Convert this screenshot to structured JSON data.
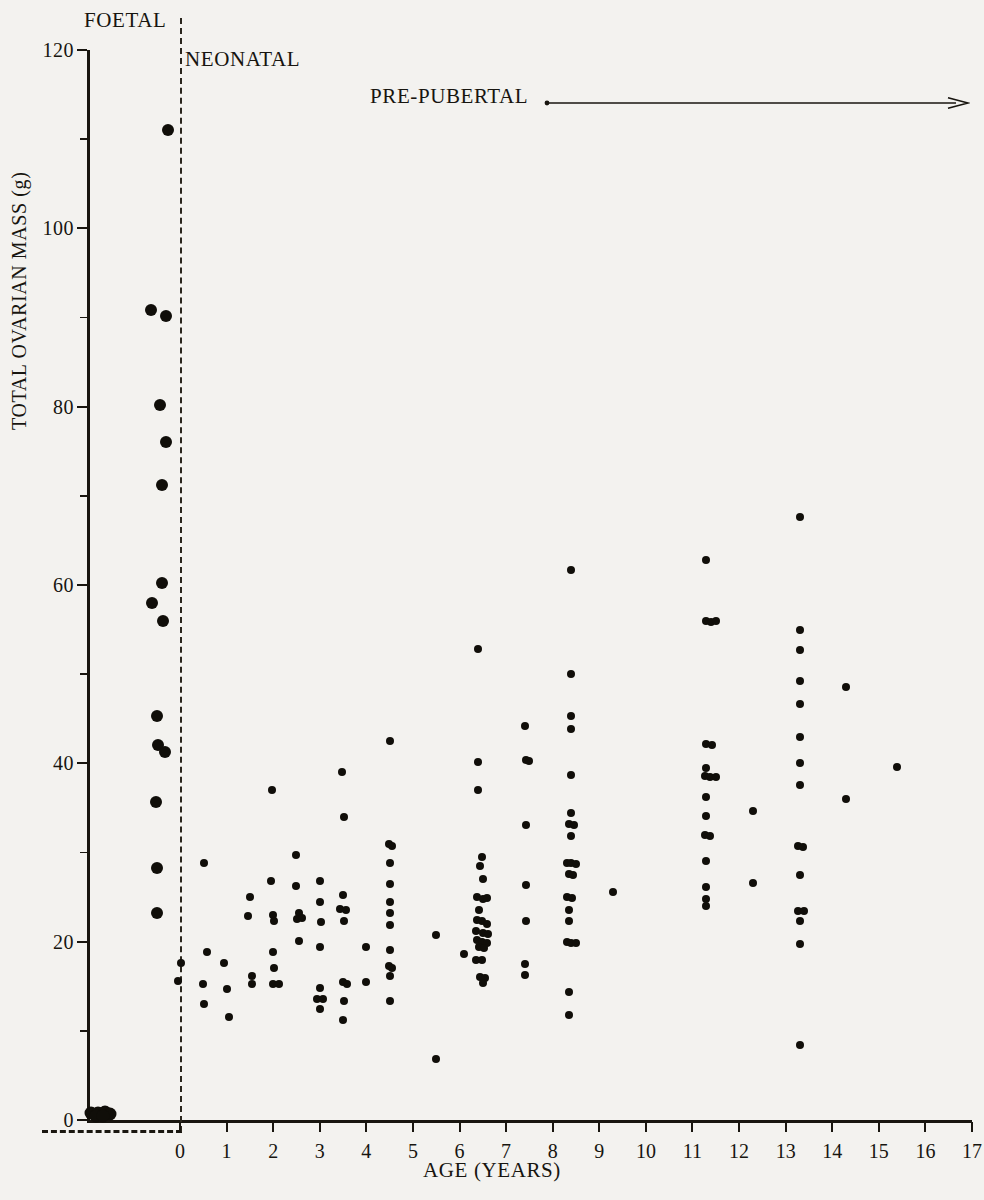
{
  "chart_data": {
    "type": "scatter",
    "title": "",
    "xlabel": "AGE (YEARS)",
    "ylabel": "TOTAL OVARIAN MASS (g)",
    "xlim": [
      0,
      17
    ],
    "ylim": [
      0,
      120
    ],
    "x_ticks": [
      0,
      1,
      2,
      3,
      4,
      5,
      6,
      7,
      8,
      9,
      10,
      11,
      12,
      13,
      14,
      15,
      16,
      17
    ],
    "y_ticks": [
      0,
      20,
      40,
      60,
      80,
      100,
      120
    ],
    "y_minor_ticks": [
      10,
      30,
      50,
      70,
      90,
      110
    ],
    "grid": false,
    "legend": null,
    "annotations": [
      {
        "name": "foetal",
        "text": "FOETAL"
      },
      {
        "name": "neonatal",
        "text": "NEONATAL"
      },
      {
        "name": "pre-pubertal",
        "text": "PRE-PUBERTAL",
        "arrow": "right"
      }
    ],
    "groups": [
      {
        "name": "foetal",
        "marker_size": 13,
        "note": "cluster of overlapping points at ~0 g, left of the age axis origin",
        "points": [
          {
            "x": -1.9,
            "y": 0.8
          },
          {
            "x": -1.75,
            "y": 0.8
          },
          {
            "x": -1.62,
            "y": 0.9
          },
          {
            "x": -1.5,
            "y": 0.7
          },
          {
            "x": -1.8,
            "y": 0.4
          },
          {
            "x": -1.66,
            "y": 0.45
          }
        ]
      },
      {
        "name": "neonatal",
        "marker_size": 12,
        "points": [
          {
            "x": -0.25,
            "y": 111.0
          },
          {
            "x": -0.62,
            "y": 90.8
          },
          {
            "x": -0.3,
            "y": 90.2
          },
          {
            "x": -0.42,
            "y": 80.2
          },
          {
            "x": -0.3,
            "y": 76.0
          },
          {
            "x": -0.38,
            "y": 71.2
          },
          {
            "x": -0.38,
            "y": 60.2
          },
          {
            "x": -0.6,
            "y": 58.0
          },
          {
            "x": -0.37,
            "y": 56.0
          },
          {
            "x": -0.5,
            "y": 45.3
          },
          {
            "x": -0.47,
            "y": 42.1
          },
          {
            "x": -0.33,
            "y": 41.3
          },
          {
            "x": -0.52,
            "y": 35.7
          },
          {
            "x": -0.5,
            "y": 28.3
          },
          {
            "x": -0.5,
            "y": 23.2
          }
        ]
      },
      {
        "name": "pre-pubertal",
        "marker_size": 8,
        "points": [
          {
            "x": 0.02,
            "y": 17.6
          },
          {
            "x": -0.04,
            "y": 15.6
          },
          {
            "x": 0.52,
            "y": 28.8
          },
          {
            "x": 0.58,
            "y": 18.8
          },
          {
            "x": 0.5,
            "y": 15.3
          },
          {
            "x": 0.52,
            "y": 13.0
          },
          {
            "x": 0.95,
            "y": 17.6
          },
          {
            "x": 1.0,
            "y": 14.7
          },
          {
            "x": 1.05,
            "y": 11.5
          },
          {
            "x": 1.45,
            "y": 22.9
          },
          {
            "x": 1.5,
            "y": 25.0
          },
          {
            "x": 1.55,
            "y": 16.2
          },
          {
            "x": 1.55,
            "y": 15.3
          },
          {
            "x": 1.98,
            "y": 37.0
          },
          {
            "x": 1.96,
            "y": 26.8
          },
          {
            "x": 2.0,
            "y": 23.0
          },
          {
            "x": 2.02,
            "y": 22.3
          },
          {
            "x": 2.0,
            "y": 18.8
          },
          {
            "x": 2.02,
            "y": 17.0
          },
          {
            "x": 2.0,
            "y": 15.3
          },
          {
            "x": 2.12,
            "y": 15.3
          },
          {
            "x": 2.5,
            "y": 29.7
          },
          {
            "x": 2.5,
            "y": 26.2
          },
          {
            "x": 2.55,
            "y": 23.2
          },
          {
            "x": 2.52,
            "y": 22.5
          },
          {
            "x": 2.62,
            "y": 22.6
          },
          {
            "x": 2.55,
            "y": 20.1
          },
          {
            "x": 3.0,
            "y": 26.8
          },
          {
            "x": 3.0,
            "y": 24.4
          },
          {
            "x": 3.02,
            "y": 22.2
          },
          {
            "x": 3.0,
            "y": 19.4
          },
          {
            "x": 3.0,
            "y": 14.8
          },
          {
            "x": 2.94,
            "y": 13.6
          },
          {
            "x": 3.06,
            "y": 13.6
          },
          {
            "x": 3.0,
            "y": 12.5
          },
          {
            "x": 3.48,
            "y": 39.0
          },
          {
            "x": 3.52,
            "y": 34.0
          },
          {
            "x": 3.5,
            "y": 25.2
          },
          {
            "x": 3.44,
            "y": 23.7
          },
          {
            "x": 3.56,
            "y": 23.6
          },
          {
            "x": 3.52,
            "y": 22.3
          },
          {
            "x": 3.5,
            "y": 15.5
          },
          {
            "x": 3.58,
            "y": 15.3
          },
          {
            "x": 3.52,
            "y": 13.3
          },
          {
            "x": 3.5,
            "y": 11.2
          },
          {
            "x": 4.0,
            "y": 19.4
          },
          {
            "x": 4.0,
            "y": 15.5
          },
          {
            "x": 4.5,
            "y": 42.5
          },
          {
            "x": 4.48,
            "y": 31.0
          },
          {
            "x": 4.54,
            "y": 30.7
          },
          {
            "x": 4.5,
            "y": 28.8
          },
          {
            "x": 4.5,
            "y": 26.5
          },
          {
            "x": 4.5,
            "y": 24.4
          },
          {
            "x": 4.5,
            "y": 23.2
          },
          {
            "x": 4.5,
            "y": 21.9
          },
          {
            "x": 4.5,
            "y": 19.1
          },
          {
            "x": 4.48,
            "y": 17.3
          },
          {
            "x": 4.56,
            "y": 17.0
          },
          {
            "x": 4.5,
            "y": 16.1
          },
          {
            "x": 4.5,
            "y": 13.3
          },
          {
            "x": 5.5,
            "y": 20.8
          },
          {
            "x": 5.5,
            "y": 6.8
          },
          {
            "x": 6.4,
            "y": 52.8
          },
          {
            "x": 6.4,
            "y": 40.2
          },
          {
            "x": 6.4,
            "y": 37.0
          },
          {
            "x": 6.48,
            "y": 29.5
          },
          {
            "x": 6.45,
            "y": 28.5
          },
          {
            "x": 6.5,
            "y": 27.0
          },
          {
            "x": 6.38,
            "y": 25.0
          },
          {
            "x": 6.5,
            "y": 24.8
          },
          {
            "x": 6.6,
            "y": 24.9
          },
          {
            "x": 6.42,
            "y": 23.6
          },
          {
            "x": 6.38,
            "y": 22.4
          },
          {
            "x": 6.48,
            "y": 22.3
          },
          {
            "x": 6.58,
            "y": 22.0
          },
          {
            "x": 6.36,
            "y": 21.2
          },
          {
            "x": 6.5,
            "y": 21.0
          },
          {
            "x": 6.62,
            "y": 20.9
          },
          {
            "x": 6.38,
            "y": 20.2
          },
          {
            "x": 6.48,
            "y": 20.0
          },
          {
            "x": 6.58,
            "y": 19.9
          },
          {
            "x": 6.42,
            "y": 19.4
          },
          {
            "x": 6.53,
            "y": 19.3
          },
          {
            "x": 6.36,
            "y": 18.0
          },
          {
            "x": 6.48,
            "y": 17.9
          },
          {
            "x": 6.44,
            "y": 16.0
          },
          {
            "x": 6.54,
            "y": 15.9
          },
          {
            "x": 6.5,
            "y": 15.4
          },
          {
            "x": 6.1,
            "y": 18.6
          },
          {
            "x": 7.4,
            "y": 44.2
          },
          {
            "x": 7.42,
            "y": 40.4
          },
          {
            "x": 7.5,
            "y": 40.3
          },
          {
            "x": 7.42,
            "y": 33.1
          },
          {
            "x": 7.42,
            "y": 26.4
          },
          {
            "x": 7.42,
            "y": 22.3
          },
          {
            "x": 7.4,
            "y": 17.5
          },
          {
            "x": 7.4,
            "y": 16.3
          },
          {
            "x": 8.4,
            "y": 61.7
          },
          {
            "x": 8.4,
            "y": 50.0
          },
          {
            "x": 8.4,
            "y": 45.3
          },
          {
            "x": 8.4,
            "y": 43.9
          },
          {
            "x": 8.4,
            "y": 38.7
          },
          {
            "x": 8.4,
            "y": 34.4
          },
          {
            "x": 8.34,
            "y": 33.2
          },
          {
            "x": 8.46,
            "y": 33.1
          },
          {
            "x": 8.4,
            "y": 31.8
          },
          {
            "x": 8.3,
            "y": 28.8
          },
          {
            "x": 8.4,
            "y": 28.8
          },
          {
            "x": 8.5,
            "y": 28.7
          },
          {
            "x": 8.34,
            "y": 27.6
          },
          {
            "x": 8.44,
            "y": 27.5
          },
          {
            "x": 8.3,
            "y": 25.0
          },
          {
            "x": 8.42,
            "y": 24.9
          },
          {
            "x": 8.34,
            "y": 23.5
          },
          {
            "x": 8.34,
            "y": 22.3
          },
          {
            "x": 8.3,
            "y": 20.0
          },
          {
            "x": 8.4,
            "y": 19.9
          },
          {
            "x": 8.5,
            "y": 19.9
          },
          {
            "x": 8.34,
            "y": 14.3
          },
          {
            "x": 8.34,
            "y": 11.8
          },
          {
            "x": 9.3,
            "y": 25.6
          },
          {
            "x": 11.3,
            "y": 62.8
          },
          {
            "x": 11.28,
            "y": 56.0
          },
          {
            "x": 11.4,
            "y": 55.9
          },
          {
            "x": 11.5,
            "y": 56.0
          },
          {
            "x": 11.3,
            "y": 42.2
          },
          {
            "x": 11.42,
            "y": 42.1
          },
          {
            "x": 11.3,
            "y": 39.5
          },
          {
            "x": 11.26,
            "y": 38.6
          },
          {
            "x": 11.38,
            "y": 38.5
          },
          {
            "x": 11.5,
            "y": 38.5
          },
          {
            "x": 11.3,
            "y": 36.2
          },
          {
            "x": 11.3,
            "y": 34.1
          },
          {
            "x": 11.26,
            "y": 32.0
          },
          {
            "x": 11.38,
            "y": 31.9
          },
          {
            "x": 11.3,
            "y": 29.0
          },
          {
            "x": 11.3,
            "y": 26.1
          },
          {
            "x": 11.3,
            "y": 24.8
          },
          {
            "x": 11.3,
            "y": 24.0
          },
          {
            "x": 12.3,
            "y": 34.7
          },
          {
            "x": 12.3,
            "y": 26.6
          },
          {
            "x": 13.3,
            "y": 67.6
          },
          {
            "x": 13.3,
            "y": 55.0
          },
          {
            "x": 13.3,
            "y": 52.7
          },
          {
            "x": 13.3,
            "y": 49.2
          },
          {
            "x": 13.3,
            "y": 46.7
          },
          {
            "x": 13.3,
            "y": 43.0
          },
          {
            "x": 13.3,
            "y": 40.0
          },
          {
            "x": 13.3,
            "y": 37.6
          },
          {
            "x": 13.26,
            "y": 30.7
          },
          {
            "x": 13.38,
            "y": 30.6
          },
          {
            "x": 13.3,
            "y": 27.5
          },
          {
            "x": 13.26,
            "y": 23.4
          },
          {
            "x": 13.4,
            "y": 23.4
          },
          {
            "x": 13.3,
            "y": 22.3
          },
          {
            "x": 13.3,
            "y": 19.7
          },
          {
            "x": 13.3,
            "y": 8.4
          },
          {
            "x": 14.3,
            "y": 48.6
          },
          {
            "x": 14.3,
            "y": 36.0
          },
          {
            "x": 15.4,
            "y": 39.6
          }
        ]
      }
    ]
  }
}
